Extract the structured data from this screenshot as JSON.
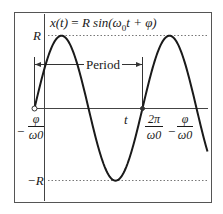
{
  "diagram": {
    "title": "x(t) = R sin(ω0t + φ)",
    "equation": {
      "lhs": "x(t)",
      "equals": "=",
      "rhs_prefix": "R sin(ω",
      "sub": "0",
      "rhs_suffix": "t + φ)"
    },
    "labels": {
      "amplitude_pos": "R",
      "amplitude_neg": "−R",
      "period": "Period",
      "time_axis": "t",
      "start_minus": "−",
      "start_num": "φ",
      "start_den": "ω0",
      "end_num1": "2π",
      "end_den1": "ω0",
      "end_minus": "−",
      "end_num2": "φ",
      "end_den2": "ω0"
    },
    "colors": {
      "curve": "#1a1a1a",
      "axis": "#444444",
      "frame": "#555555",
      "dotted": "#777777"
    }
  },
  "chart_data": {
    "type": "line",
    "xlabel": "t",
    "ylabel": "x(t)",
    "series": [
      {
        "name": "x(t) = R sin(ω0t + φ)",
        "function": "R*sin(ω0*t + φ)"
      }
    ],
    "x_ticks": [
      "−φ/ω0",
      "2π/ω0 − φ/ω0"
    ],
    "y_ticks": [
      "R",
      "−R"
    ],
    "annotations": [
      "Period (from −φ/ω0 to 2π/ω0 − φ/ω0)"
    ],
    "cycles_shown": 1.6,
    "grid": false
  }
}
